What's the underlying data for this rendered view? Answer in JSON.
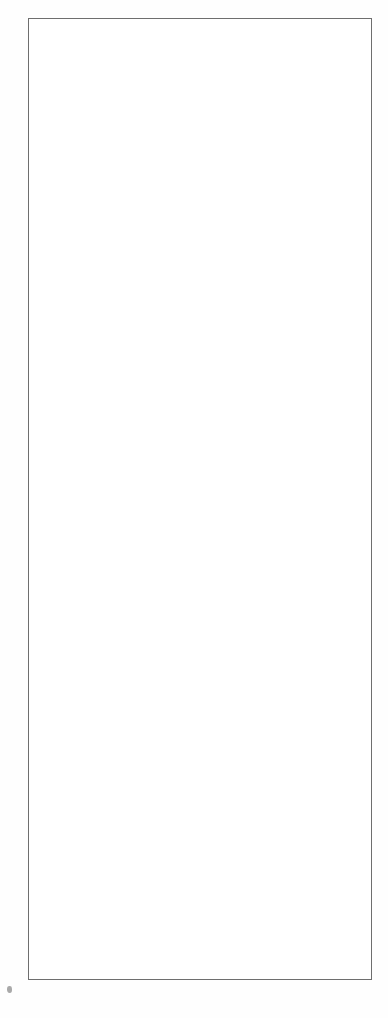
{
  "chart_data": {
    "type": "bar",
    "orientation": "vertical",
    "title": "",
    "xlabel": "Security Scope for Assessment",
    "ylabel": "Assessment Score (%)",
    "ylim": [
      0,
      100
    ],
    "ytick_labels": [
      "0%",
      "20%",
      "40%",
      "60%",
      "80%",
      "100%"
    ],
    "ytick_values": [
      0,
      20,
      40,
      60,
      80,
      100
    ],
    "grid": true,
    "legend_position": "bottom",
    "categories": [
      "Security\nInfrastructure",
      "General\nBusiness Users",
      "Business App\nServers",
      "SOX Regulated\nSystems",
      "PCI Regulated\nSystems",
      "HIPAA\nRegulated\nSystems"
    ],
    "series": [
      {
        "name": "Year 1",
        "color": "#808080",
        "values": [
          55,
          42,
          55,
          58,
          62,
          66
        ]
      },
      {
        "name": "Year 2",
        "color": "#949494",
        "values": [
          56,
          44,
          57,
          60,
          64,
          68
        ]
      },
      {
        "name": "Year 3",
        "color": "#ababab",
        "values": [
          57,
          45,
          59,
          62,
          66,
          69
        ]
      },
      {
        "name": "Year 4",
        "color": "#c6c6c6",
        "values": [
          57,
          46,
          60,
          63,
          68,
          71
        ]
      },
      {
        "name": "Year 5",
        "color": "#e3e3e3",
        "values": [
          58,
          48,
          62,
          65,
          70,
          72
        ]
      }
    ]
  },
  "colors": {
    "axis": "#9a9a9a",
    "grid": "#c9c9c9",
    "text": "#1f1f1f",
    "frame": "#6e6e6e",
    "bar_border": "#9b9b9b"
  }
}
